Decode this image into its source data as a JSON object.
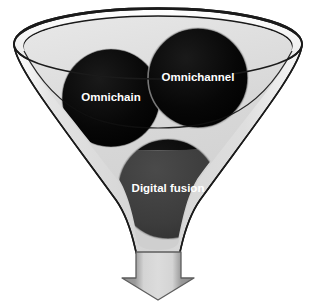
{
  "diagram": {
    "type": "funnel-venn",
    "title": "",
    "background_color": "#ffffff",
    "funnel": {
      "name": "funnel",
      "rim_outer_color": "#f2f2f2",
      "rim_inner_color": "#dcdcdc",
      "body_color": "#d6d6d6",
      "outline_color": "#1a1a1a"
    },
    "circles": [
      {
        "id": "omnichain",
        "label": "Omnichain",
        "color_top": "#050505",
        "color_bottom": "#3e3e3e",
        "label_color": "#ffffff",
        "cx": 111,
        "cy": 98,
        "r": 49
      },
      {
        "id": "omnichannel",
        "label": "Omnichannel",
        "color_top": "#050505",
        "color_bottom": "#3e3e3e",
        "label_color": "#ffffff",
        "cx": 198,
        "cy": 78,
        "r": 50
      },
      {
        "id": "digital-fusion",
        "label": "Digital fusion",
        "color_top": "#3e3e3e",
        "color_bottom": "#3e3e3e",
        "label_color": "#ffffff",
        "cx": 168,
        "cy": 189,
        "r": 50
      }
    ],
    "arrow": {
      "id": "down-arrow",
      "direction": "down",
      "fill_light": "#d0d0d0",
      "fill_dark": "#8a8a8a",
      "outline_color": "#5a5a5a"
    }
  }
}
